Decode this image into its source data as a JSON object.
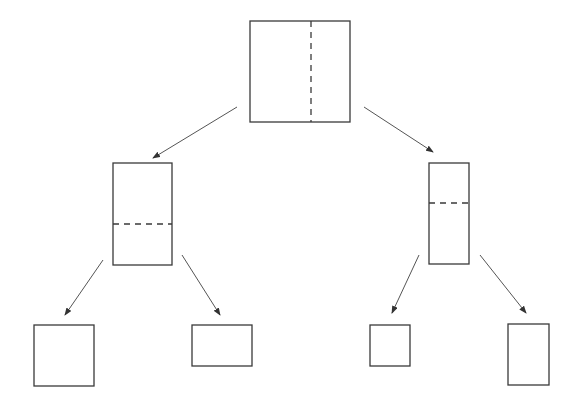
{
  "diagram": {
    "type": "binary-partition-tree",
    "colors": {
      "stroke": "#3a3a3a",
      "arrow": "#555555",
      "background": "#ffffff"
    },
    "nodes": [
      {
        "id": "root",
        "x": 250,
        "y": 21,
        "w": 100,
        "h": 101,
        "split": {
          "orientation": "vertical",
          "at": 311
        }
      },
      {
        "id": "left",
        "x": 113,
        "y": 163,
        "w": 59,
        "h": 102,
        "split": {
          "orientation": "horizontal",
          "at": 224
        }
      },
      {
        "id": "right",
        "x": 429,
        "y": 163,
        "w": 40,
        "h": 101,
        "split": {
          "orientation": "horizontal",
          "at": 203
        }
      },
      {
        "id": "left-left",
        "x": 34,
        "y": 325,
        "w": 60,
        "h": 61,
        "split": null
      },
      {
        "id": "left-right",
        "x": 192,
        "y": 325,
        "w": 60,
        "h": 41,
        "split": null
      },
      {
        "id": "right-left",
        "x": 370,
        "y": 325,
        "w": 40,
        "h": 41,
        "split": null
      },
      {
        "id": "right-right",
        "x": 508,
        "y": 324,
        "w": 41,
        "h": 61,
        "split": null
      }
    ],
    "edges": [
      {
        "from": "root",
        "to": "left",
        "x1": 237,
        "y1": 107,
        "x2": 153,
        "y2": 158
      },
      {
        "from": "root",
        "to": "right",
        "x1": 364,
        "y1": 107,
        "x2": 433,
        "y2": 152
      },
      {
        "from": "left",
        "to": "left-left",
        "x1": 103,
        "y1": 260,
        "x2": 65,
        "y2": 315
      },
      {
        "from": "left",
        "to": "left-right",
        "x1": 182,
        "y1": 255,
        "x2": 220,
        "y2": 315
      },
      {
        "from": "right",
        "to": "right-left",
        "x1": 419,
        "y1": 255,
        "x2": 392,
        "y2": 313
      },
      {
        "from": "right",
        "to": "right-right",
        "x1": 480,
        "y1": 255,
        "x2": 526,
        "y2": 313
      }
    ]
  }
}
